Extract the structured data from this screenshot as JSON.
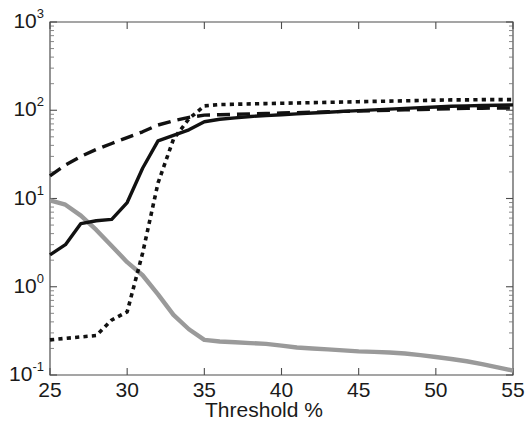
{
  "chart_data": {
    "type": "line",
    "title": "",
    "xlabel": "Threshold %",
    "ylabel": "",
    "xlim": [
      25,
      55
    ],
    "ylim": [
      0.1,
      1000
    ],
    "yscale": "log",
    "xscale": "linear",
    "grid": false,
    "legend": "none",
    "xticks": [
      25,
      30,
      35,
      40,
      45,
      50,
      55
    ],
    "xticklabels": [
      "25",
      "30",
      "35",
      "40",
      "45",
      "50",
      "55"
    ],
    "yticks": [
      0.1,
      1,
      10,
      100,
      1000
    ],
    "yticklabels": [
      "10-1",
      "100",
      "101",
      "102",
      "103"
    ],
    "ytick_mantissa": "10",
    "ytick_exponents": [
      "-1",
      "0",
      "1",
      "2",
      "3"
    ],
    "x": [
      25,
      26,
      27,
      28,
      29,
      30,
      31,
      32,
      33,
      34,
      35,
      36,
      37,
      38,
      39,
      40,
      41,
      42,
      43,
      44,
      45,
      46,
      47,
      48,
      49,
      50,
      51,
      52,
      53,
      54,
      55
    ],
    "series": [
      {
        "name": "solid-black",
        "style": "solid",
        "color": "#111111",
        "width": 3.4,
        "values": [
          2.3,
          3.0,
          5.2,
          5.6,
          5.8,
          9.0,
          22.0,
          45.0,
          52.0,
          60.0,
          74.0,
          79.0,
          82.0,
          85.0,
          87.0,
          89.0,
          91.0,
          93.0,
          95.0,
          97.0,
          99.0,
          101.0,
          103.0,
          105.0,
          107.0,
          109.0,
          111.0,
          112.0,
          113.0,
          114.0,
          115.0
        ]
      },
      {
        "name": "dashed-black",
        "style": "dashed",
        "color": "#111111",
        "width": 3.4,
        "values": [
          18.0,
          24.0,
          30.0,
          36.0,
          42.0,
          49.0,
          57.0,
          68.0,
          76.0,
          83.0,
          88.0,
          89.0,
          90.0,
          91.0,
          92.0,
          93.0,
          94.0,
          95.0,
          96.0,
          97.0,
          98.0,
          99.0,
          100.0,
          101.0,
          102.0,
          103.0,
          104.0,
          105.0,
          105.5,
          106.0,
          106.0
        ]
      },
      {
        "name": "dotted-black",
        "style": "dotted",
        "color": "#111111",
        "width": 3.6,
        "values": [
          0.25,
          0.26,
          0.27,
          0.28,
          0.42,
          0.52,
          2.4,
          15.0,
          47.0,
          80.0,
          112.0,
          116.0,
          117.0,
          118.0,
          119.0,
          120.0,
          121.0,
          122.0,
          123.0,
          124.0,
          125.0,
          126.0,
          127.0,
          128.0,
          129.0,
          130.0,
          131.0,
          131.0,
          132.0,
          132.0,
          132.0
        ]
      },
      {
        "name": "solid-gray",
        "style": "solid",
        "color": "#9a9a9a",
        "width": 4.4,
        "values": [
          9.5,
          8.5,
          6.4,
          4.4,
          2.9,
          1.9,
          1.35,
          0.82,
          0.48,
          0.33,
          0.25,
          0.24,
          0.235,
          0.23,
          0.225,
          0.215,
          0.205,
          0.2,
          0.195,
          0.19,
          0.185,
          0.183,
          0.18,
          0.175,
          0.168,
          0.16,
          0.152,
          0.143,
          0.133,
          0.122,
          0.112
        ]
      }
    ]
  },
  "axes": {
    "xlabel_text": "Threshold %"
  }
}
